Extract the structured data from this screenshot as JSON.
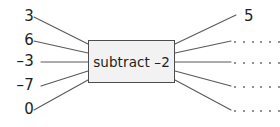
{
  "diagram": {
    "type": "function-machine",
    "machine": {
      "operation_label": "subtract –2",
      "operation": "subtract",
      "operand": "–2",
      "fill_color": "#f2f2f2",
      "border_color": "#4d4d4f"
    },
    "text_color": "#231f20",
    "line_color": "#58595b",
    "dot_color": "#6d6e71",
    "inputs": [
      {
        "label": "3",
        "value": 3
      },
      {
        "label": "6",
        "value": 6
      },
      {
        "label": "–3",
        "value": -3
      },
      {
        "label": "–7",
        "value": -7
      },
      {
        "label": "0",
        "value": 0
      }
    ],
    "outputs": [
      {
        "label": "5",
        "filled": true,
        "value": 5
      },
      {
        "label": "······",
        "filled": false,
        "value": null
      },
      {
        "label": "······",
        "filled": false,
        "value": null
      },
      {
        "label": "······",
        "filled": false,
        "value": null
      },
      {
        "label": "······",
        "filled": false,
        "value": null
      }
    ]
  }
}
